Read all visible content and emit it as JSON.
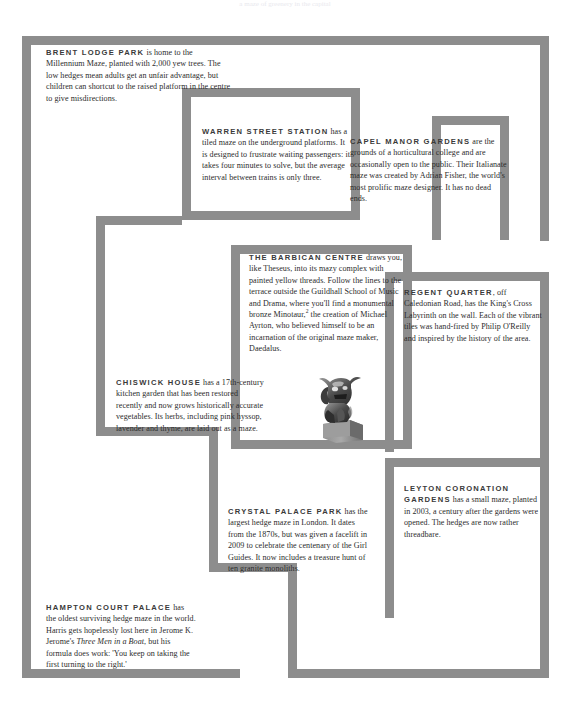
{
  "page": {
    "width": 570,
    "height": 710,
    "background": "#ffffff",
    "wall_color": "#8d8d8d",
    "text_color": "#2c2c2c",
    "heading_color": "#3a3a3a",
    "top_remnant": "a maze of greenery in the capital"
  },
  "entries": [
    {
      "id": "brent-lodge-park",
      "name": "BRENT LODGE PARK",
      "body": " is home to the Millennium Maze, planted with 2,000 yew trees. The low hedges mean adults get an unfair advantage, but children can shortcut to the raised platform in the centre to give misdirections."
    },
    {
      "id": "warren-street-station",
      "name": "WARREN STREET STATION",
      "body": " has a tiled maze on the underground platforms. It is designed to frustrate waiting passengers: it takes four minutes to solve, but the average interval between trains is only three."
    },
    {
      "id": "capel-manor-gardens",
      "name": "CAPEL MANOR GARDENS",
      "body": " are the grounds of a horticultural college and are occasionally open to the public. Their Italianate maze was created by Adrian Fisher, the world's most prolific maze designer. It has no dead ends."
    },
    {
      "id": "the-barbican-centre",
      "name": "THE BARBICAN CENTRE",
      "body_1": " draws you, like Theseus, into its mazy complex with painted yellow threads. Follow the lines to the terrace outside the Guildhall School of Music and Drama, where you'll find a monumental bronze Minotaur,",
      "footnote_marker": "2",
      "body_2": " the creation of Michael Ayrton, who believed himself to be an incarnation of the original maze maker, Daedalus.",
      "image_caption": "bronze minotaur statue on plinth"
    },
    {
      "id": "regent-quarter",
      "name": "REGENT QUARTER",
      "body": ", off Caledonian Road, has the King's Cross Labyrinth on the wall. Each of the vibrant tiles was hand-fired by Philip O'Reilly and inspired by the history of the area."
    },
    {
      "id": "chiswick-house",
      "name": "CHISWICK HOUSE",
      "body": " has a 17th-century kitchen garden that has been restored recently and now grows historically accurate vegetables. Its herbs, including pink hyssop, lavender and thyme, are laid out as a maze."
    },
    {
      "id": "crystal-palace-park",
      "name": "CRYSTAL PALACE PARK",
      "body": " has the largest hedge maze in London. It dates from the 1870s, but was given a facelift in 2009 to celebrate the centenary of the Girl Guides. It now includes a treasure hunt of ten granite monoliths."
    },
    {
      "id": "leyton-coronation-gardens",
      "name": "LEYTON CORONATION GARDENS",
      "body": " has a small maze, planted in 2003, a century after the gardens were opened.  The hedges are now rather threadbare."
    },
    {
      "id": "hampton-court-palace",
      "name": "HAMPTON COURT PALACE",
      "body_1": " has the oldest surviving hedge maze in the world. Harris gets hopelessly lost here in Jerome K. Jerome's ",
      "book_title": "Three Men in a Boat",
      "body_2": ", but his formula does work: 'You keep on taking the first turning to the right.'"
    }
  ],
  "walls": [
    {
      "name": "outer-top",
      "x": 22,
      "y": 36,
      "w": 527,
      "h": 9
    },
    {
      "name": "outer-left",
      "x": 22,
      "y": 36,
      "w": 9,
      "h": 642
    },
    {
      "name": "outer-bottom-left",
      "x": 22,
      "y": 669,
      "w": 218,
      "h": 9
    },
    {
      "name": "outer-bottom-right",
      "x": 288,
      "y": 669,
      "w": 261,
      "h": 9
    },
    {
      "name": "outer-right-upper",
      "x": 540,
      "y": 36,
      "w": 9,
      "h": 205
    },
    {
      "name": "outer-right-lower",
      "x": 540,
      "y": 272,
      "w": 9,
      "h": 406
    },
    {
      "name": "room-warren-top",
      "x": 182,
      "y": 88,
      "w": 240,
      "h": 9
    },
    {
      "name": "room-warren-left",
      "x": 182,
      "y": 88,
      "w": 9,
      "h": 132
    },
    {
      "name": "room-warren-bottom",
      "x": 182,
      "y": 211,
      "w": 178,
      "h": 9
    },
    {
      "name": "room-warren-right",
      "x": 168,
      "y": 220,
      "w": 9,
      "h": 0
    },
    {
      "name": "capel-left",
      "x": 351,
      "y": 120,
      "w": 9,
      "h": 100
    },
    {
      "name": "capel-top",
      "x": 351,
      "y": 120,
      "w": 90,
      "h": 9
    },
    {
      "name": "capel-right",
      "x": 500,
      "y": 116,
      "w": 9,
      "h": 124
    },
    {
      "name": "capel-right-top",
      "x": 432,
      "y": 116,
      "w": 77,
      "h": 9
    },
    {
      "name": "barbican-left",
      "x": 231,
      "y": 245,
      "w": 9,
      "h": 204
    },
    {
      "name": "barbican-top",
      "x": 231,
      "y": 245,
      "w": 181,
      "h": 9
    },
    {
      "name": "barbican-right",
      "x": 403,
      "y": 245,
      "w": 9,
      "h": 204
    },
    {
      "name": "barbican-bottom",
      "x": 231,
      "y": 440,
      "w": 181,
      "h": 9
    },
    {
      "name": "chiswick-upper-left",
      "x": 96,
      "y": 216,
      "w": 9,
      "h": 219
    },
    {
      "name": "chiswick-upper-top",
      "x": 96,
      "y": 216,
      "w": 86,
      "h": 9
    },
    {
      "name": "chiswick-bottom",
      "x": 96,
      "y": 427,
      "w": 122,
      "h": 9
    },
    {
      "name": "chiswick-right-down",
      "x": 209,
      "y": 427,
      "w": 9,
      "h": 145
    },
    {
      "name": "regent-left",
      "x": 385,
      "y": 272,
      "w": 9,
      "h": 180
    },
    {
      "name": "regent-top",
      "x": 385,
      "y": 272,
      "w": 164,
      "h": 9
    },
    {
      "name": "leyton-left",
      "x": 385,
      "y": 458,
      "w": 9,
      "h": 160
    },
    {
      "name": "leyton-top",
      "x": 385,
      "y": 458,
      "w": 164,
      "h": 9
    },
    {
      "name": "crystal-left",
      "x": 209,
      "y": 563,
      "w": 9,
      "h": 106
    },
    {
      "name": "crystal-bottom",
      "x": 209,
      "y": 563,
      "w": 79,
      "h": 9
    },
    {
      "name": "crystal-right",
      "x": 288,
      "y": 563,
      "w": 9,
      "h": 106
    }
  ]
}
